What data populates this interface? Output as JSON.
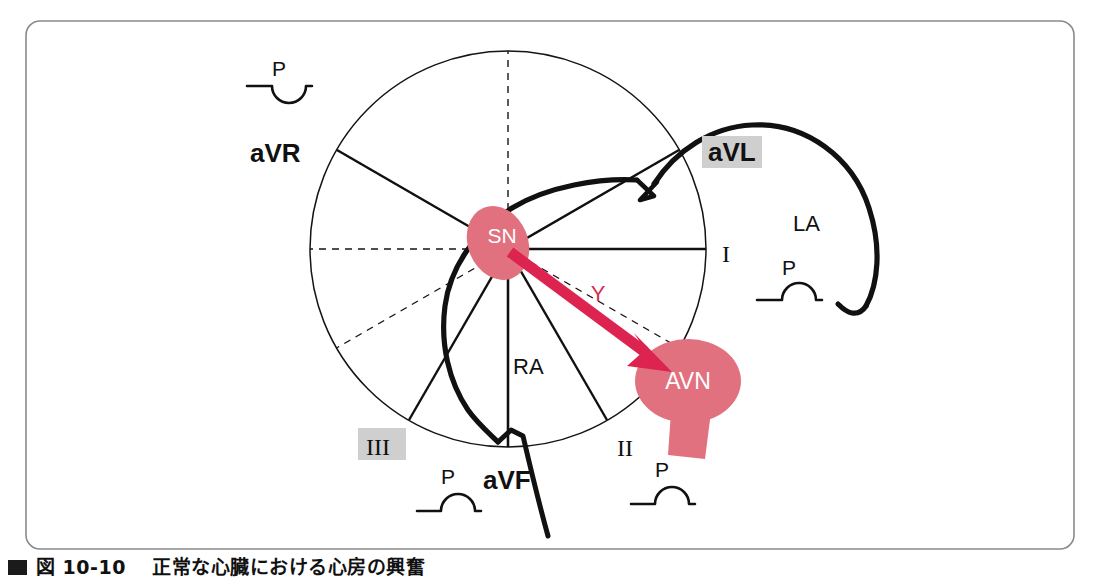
{
  "figure": {
    "border_color": "#7f7f7f",
    "background": "#ffffff",
    "caption_marker": "black-square-marker",
    "caption": "図 10-10　 正常な心臓における心房の興奮"
  },
  "palette": {
    "node_fill": "#e2717f",
    "vector_red": "#dd2450",
    "vector_label_red": "#d62c4e",
    "outline_black": "#111111",
    "highlight_gray": "#cfcfcf",
    "axis_thin": "#1a1a1a"
  },
  "hexaxial": {
    "center": {
      "x": 508,
      "y": 249
    },
    "radius": 198,
    "solid_axis_angles_deg": [
      0,
      60,
      120,
      180,
      240,
      300
    ],
    "dashed_axis_angles_deg": [
      30,
      90,
      150,
      210,
      270,
      330
    ],
    "labels": [
      {
        "id": "lead-avr",
        "text": "aVR",
        "x": 250,
        "y": 153,
        "highlighted": false,
        "bold": true
      },
      {
        "id": "lead-avl",
        "text": "aVL",
        "x": 707,
        "y": 156,
        "highlighted": true,
        "bold": true
      },
      {
        "id": "lead-i",
        "text": "I",
        "x": 726,
        "y": 254,
        "highlighted": false,
        "bold": false
      },
      {
        "id": "lead-ii",
        "text": "II",
        "x": 623,
        "y": 448,
        "highlighted": false,
        "bold": false
      },
      {
        "id": "lead-iii",
        "text": "III",
        "x": 377,
        "y": 447,
        "highlighted": true,
        "bold": false
      },
      {
        "id": "lead-avf",
        "text": "aVF",
        "x": 489,
        "y": 479,
        "highlighted": false,
        "bold": true
      }
    ]
  },
  "anatomy": {
    "sinus_node": {
      "label": "SN",
      "cx": 498,
      "cy": 243,
      "rx": 30,
      "ry": 38,
      "rotation_deg": -22
    },
    "av_node": {
      "label": "AVN",
      "cx": 688,
      "cy": 381,
      "rx": 53,
      "ry": 42
    },
    "right_atrium_label": "RA",
    "left_atrium_label": "LA",
    "vector_label": "Y"
  },
  "p_waves": [
    {
      "id": "p-wave-avr",
      "lead": "aVR",
      "label": "P",
      "polarity": "inverted",
      "x": 247,
      "y": 70
    },
    {
      "id": "p-wave-avl",
      "lead": "aVL",
      "label": "P",
      "polarity": "upright",
      "x": 765,
      "y": 268
    },
    {
      "id": "p-wave-avf",
      "lead": "aVF",
      "label": "P",
      "polarity": "upright",
      "x": 417,
      "y": 470
    },
    {
      "id": "p-wave-ii",
      "lead": "II",
      "label": "P",
      "polarity": "upright",
      "x": 636,
      "y": 466
    }
  ]
}
